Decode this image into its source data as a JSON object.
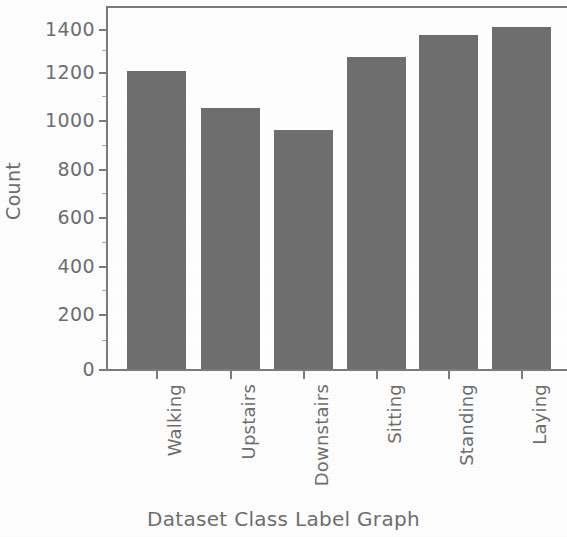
{
  "chart_data": {
    "type": "bar",
    "title": "",
    "xlabel": "Dataset Class Label Graph",
    "ylabel": "Count",
    "categories": [
      "Walking",
      "Upstairs",
      "Downstairs",
      "Sitting",
      "Standing",
      "Laying"
    ],
    "values": [
      1226,
      1073,
      986,
      1286,
      1374,
      1407
    ],
    "series": [
      {
        "name": "Count",
        "values": [
          1226,
          1073,
          986,
          1286,
          1374,
          1407
        ]
      }
    ],
    "ylim": [
      0,
      1450
    ],
    "xlim": [
      -0.6,
      5.6
    ],
    "yticks": [
      0,
      200,
      400,
      600,
      800,
      1000,
      1200,
      1400
    ],
    "ytick_labels": [
      "0",
      "200",
      "400",
      "600",
      "800",
      "1000",
      "1200",
      "1400"
    ],
    "xtick_labels": [
      "Walking",
      "Upstairs",
      "Downstairs",
      "Sitting",
      "Standing",
      "Laying"
    ],
    "xtick_rotation": 90,
    "grid": false,
    "legend": null,
    "bar_color": "#6e6e6e",
    "axis_color": "#7b7b7b",
    "text_color": "#6e6e6e",
    "background_color": "#fdfdfd"
  }
}
